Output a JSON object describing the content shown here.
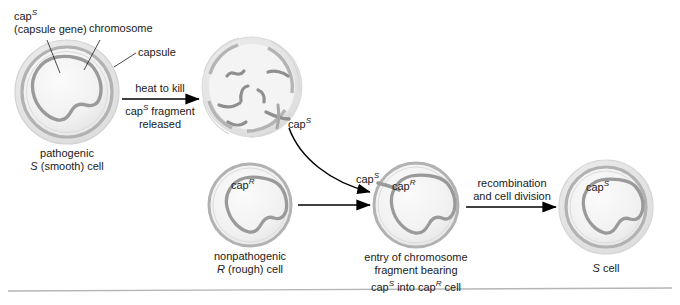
{
  "figure": {
    "colors": {
      "capsule_halo": "#e3e3e3",
      "cell_wall": "#b0b0b0",
      "cytoplasm": "#f0f0f0",
      "chromosome": "#9a9a9a",
      "arrow": "#000000",
      "text": "#1a1a1a",
      "rule": "#b5b5b5"
    }
  },
  "callouts": {
    "cap_s_gene_line1": "cap",
    "cap_s_gene_sup": "S",
    "cap_s_gene_line2": "(capsule gene)",
    "chromosome": "chromosome",
    "capsule": "capsule"
  },
  "cells": {
    "s_cell": {
      "caption_line1": "pathogenic",
      "caption_italic": "S",
      "caption_rest": " (smooth) cell"
    },
    "dead_cell": {
      "fragment_label": "cap",
      "fragment_label_sup": "S"
    },
    "r_cell": {
      "inner_label": "cap",
      "inner_label_sup": "R",
      "caption_line1": "nonpathogenic",
      "caption_italic": "R",
      "caption_rest": " (rough) cell"
    },
    "transformed_cell": {
      "entering_label": "cap",
      "entering_label_sup": "S",
      "inner_label": "cap",
      "inner_label_sup": "R",
      "caption_line1": "entry of chromosome",
      "caption_line2": "fragment bearing",
      "caption_line3_a": "cap",
      "caption_line3_sup": "S",
      "caption_line3_b": " into cap",
      "caption_line3_sup2": "R",
      "caption_line3_c": " cell"
    },
    "final_s_cell": {
      "inner_label": "cap",
      "inner_label_sup": "S",
      "caption_italic": "S",
      "caption_rest": " cell"
    }
  },
  "arrows": {
    "heat": {
      "above": "heat to kill",
      "below_a": "cap",
      "below_sup": "S",
      "below_b": " fragment",
      "below_line2": "released"
    },
    "recombination": {
      "line1": "recombination",
      "line2": "and cell division"
    }
  }
}
